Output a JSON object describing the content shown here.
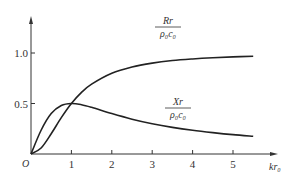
{
  "chart_data": {
    "type": "line",
    "title": "",
    "xlabel": "kr₀",
    "ylabel": "",
    "origin_label": "O",
    "xlim": [
      0,
      5.9
    ],
    "ylim": [
      0,
      1.3
    ],
    "x_ticks": [
      1,
      2,
      3,
      4,
      5
    ],
    "x_tick_labels": [
      "1",
      "2",
      "3",
      "4",
      "5"
    ],
    "y_ticks": [
      0.5,
      1.0
    ],
    "y_tick_labels": [
      "0.5",
      "1.0"
    ],
    "grid": false,
    "series": [
      {
        "name": "R_r/(ρ₀c₀)",
        "label_num": "Rr",
        "label_den": "ρ₀c₀",
        "x": [
          0,
          0.25,
          0.5,
          0.75,
          1,
          1.25,
          1.5,
          2,
          2.5,
          3,
          3.5,
          4,
          4.5,
          5,
          5.5
        ],
        "y": [
          0,
          0.059,
          0.2,
          0.36,
          0.5,
          0.61,
          0.692,
          0.8,
          0.862,
          0.9,
          0.925,
          0.941,
          0.953,
          0.962,
          0.968
        ]
      },
      {
        "name": "X_r/(ρ₀c₀)",
        "label_num": "Xr",
        "label_den": "ρ₀c₀",
        "x": [
          0,
          0.25,
          0.5,
          0.75,
          1,
          1.25,
          1.5,
          2,
          2.5,
          3,
          3.5,
          4,
          4.5,
          5,
          5.5
        ],
        "y": [
          0,
          0.235,
          0.4,
          0.48,
          0.5,
          0.488,
          0.462,
          0.4,
          0.345,
          0.3,
          0.264,
          0.235,
          0.212,
          0.192,
          0.176
        ]
      }
    ]
  }
}
